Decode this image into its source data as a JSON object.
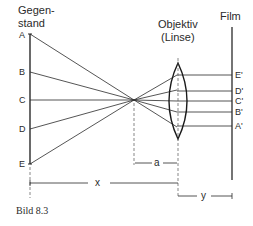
{
  "diagram": {
    "type": "optics-camera-lens",
    "labels": {
      "object_title_line1": "Gegen-",
      "object_title_line2": "stand",
      "lens_title_line1": "Objektiv",
      "lens_title_line2": "(Linse)",
      "film_title": "Film"
    },
    "object_points": [
      {
        "label": "A",
        "y": 34
      },
      {
        "label": "B",
        "y": 72
      },
      {
        "label": "C",
        "y": 100
      },
      {
        "label": "D",
        "y": 129
      },
      {
        "label": "E",
        "y": 163
      }
    ],
    "image_points": [
      {
        "label": "A'",
        "y": 126
      },
      {
        "label": "B'",
        "y": 112
      },
      {
        "label": "C'",
        "y": 101
      },
      {
        "label": "D'",
        "y": 91
      },
      {
        "label": "E'",
        "y": 75
      }
    ],
    "dimensions": {
      "x_label": "x",
      "a_label": "a",
      "y_label": "y"
    },
    "caption": "Bild 8.3",
    "colors": {
      "stroke": "#2a2a2a",
      "background": "#ffffff"
    }
  }
}
